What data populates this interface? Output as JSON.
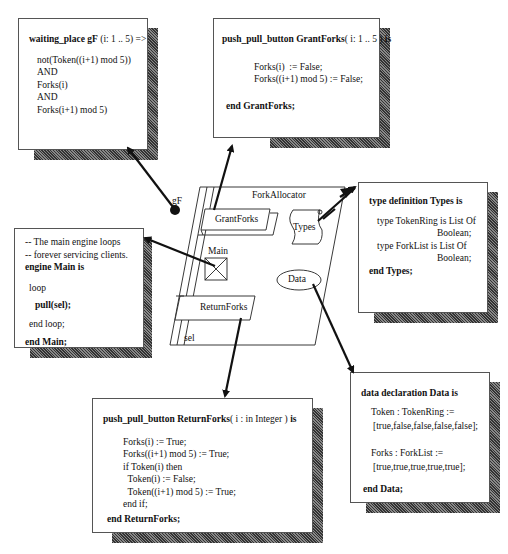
{
  "diagram": {
    "component": {
      "title": "ForkAllocator",
      "elements": {
        "grant_button": "GrantForks",
        "types_symbol": "Types",
        "main_engine": "Main",
        "data_store": "Data",
        "return_button": "ReturnForks",
        "sel_label": "sel",
        "gf_label": "gF"
      }
    },
    "waiting_place_box": {
      "header": "waiting_place gF (i: 1 .. 5) =>",
      "header_bold": "waiting_place gF",
      "header_rest": " (i: 1 .. 5) =>",
      "lines": [
        "not(Token((i+1) mod 5))",
        "AND",
        "Forks(i)",
        "AND",
        "Forks(i+1) mod 5)"
      ]
    },
    "grant_forks_box": {
      "header_bold": "push_pull_button GrantForks",
      "header_rest": "( i: 1 .. 5 )",
      "header_tail": " is",
      "lines": [
        "Forks(i)  := False;",
        "Forks((i+1) mod 5) := False;"
      ],
      "footer": "end GrantForks;"
    },
    "main_box": {
      "comments": [
        "-- The main engine loops",
        "-- forever servicing clients."
      ],
      "header": "engine Main is",
      "loop": "loop",
      "pull": "pull(sel);",
      "end_loop": "end loop;",
      "footer": "end Main;"
    },
    "types_box": {
      "header": "type definition Types is",
      "lines": [
        "type TokenRing is List Of",
        "Boolean;",
        "type ForkList is List Of",
        "Boolean;"
      ],
      "footer": "end Types;"
    },
    "data_box": {
      "header": "data declaration Data is",
      "token_decl": "Token : TokenRing :=",
      "token_value": "[true,false,false,false,false];",
      "forks_decl": "Forks : ForkList :=",
      "forks_value": "[true,true,true,true,true];",
      "footer": "end Data;"
    },
    "return_forks_box": {
      "header_bold": "push_pull_button ReturnForks",
      "header_rest": "( i : in Integer  )",
      "header_tail": "  is",
      "lines": [
        "Forks(i) := True;",
        "Forks((i+1) mod 5) := True;",
        "if Token(i) then",
        "  Token(i) := False;",
        "  Token((i+1) mod 5) := True;",
        "end if;"
      ],
      "footer": "end ReturnForks;"
    }
  }
}
